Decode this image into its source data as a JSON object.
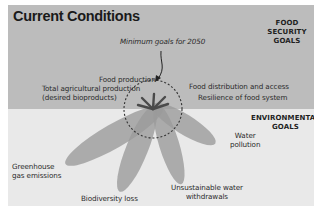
{
  "title": "Current Conditions",
  "goals": {
    "food_security": [
      "FOOD SECURITY",
      "GOALS"
    ],
    "environmental": [
      "ENVIRONMENTAL",
      "GOALS"
    ]
  },
  "annotation": "Minimum goals for 2050",
  "food_security_labels": {
    "food_production": "Food production",
    "total_ag_line1": "Total agricultural production",
    "total_ag_line2": "(desired bioproducts)",
    "distribution": "Food distribution and access",
    "resilience": "Resilience of food system"
  },
  "environmental_labels": {
    "ghg_line1": "Greenhouse",
    "ghg_line2": "gas emissions",
    "biodiversity": "Biodiversity loss",
    "water_withdrawals_line1": "Unsustainable water",
    "water_withdrawals_line2": "withdrawals",
    "water_pollution_line1": "Water",
    "water_pollution_line2": "pollution"
  },
  "colors": {
    "top_band": "#bcbcbc",
    "bottom_band": "#e9e9e9",
    "petal": "#9a9a9a",
    "sprout": "#4a4a4a",
    "circle": "#333333"
  }
}
